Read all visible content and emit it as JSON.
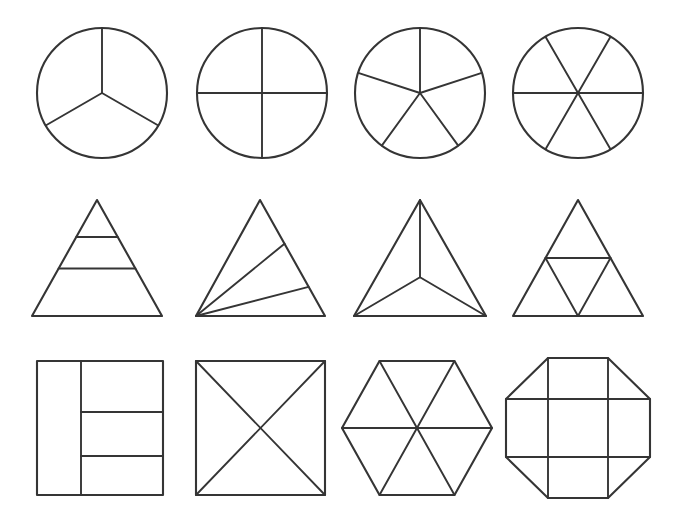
{
  "page": {
    "background_color": "#ffffff",
    "line_color": "#353535",
    "width": 678,
    "height": 519,
    "rows": 3,
    "columns": 4,
    "total_shapes": 12
  },
  "shapes": [
    {
      "id": "circle-thirds",
      "row": 1,
      "column": 1,
      "base_shape": "circle",
      "parts": 3,
      "fraction": "1/3",
      "division": "three radii at 90, 210 and 330 degrees",
      "equal_parts": true,
      "center": {
        "x": 102,
        "y": 93
      },
      "radius": 65
    },
    {
      "id": "circle-quarters",
      "row": 1,
      "column": 2,
      "base_shape": "circle",
      "parts": 4,
      "fraction": "1/4",
      "division": "vertical and horizontal diameters",
      "equal_parts": true,
      "center": {
        "x": 262,
        "y": 93
      },
      "radius": 65
    },
    {
      "id": "circle-fifths",
      "row": 1,
      "column": 3,
      "base_shape": "circle",
      "parts": 5,
      "fraction": "1/5",
      "division": "five radii at 72 degree spacing starting at 90 degrees",
      "equal_parts": true,
      "center": {
        "x": 420,
        "y": 93
      },
      "radius": 65
    },
    {
      "id": "circle-sixths",
      "row": 1,
      "column": 4,
      "base_shape": "circle",
      "parts": 6,
      "fraction": "1/6",
      "division": "three diameters at 0, 60 and 120 degrees",
      "equal_parts": true,
      "center": {
        "x": 578,
        "y": 93
      },
      "radius": 65
    },
    {
      "id": "triangle-horizontal-bands",
      "row": 2,
      "column": 1,
      "base_shape": "triangle",
      "parts": 3,
      "fraction": "unequal thirds",
      "division": "two horizontal lines parallel to the base",
      "equal_parts": false,
      "apex": {
        "x": 97,
        "y": 200
      },
      "base_left": {
        "x": 32,
        "y": 316
      },
      "base_right": {
        "x": 162,
        "y": 316
      }
    },
    {
      "id": "triangle-oblique-bands",
      "row": 2,
      "column": 2,
      "base_shape": "triangle",
      "parts": 3,
      "fraction": "unequal thirds",
      "division": "two slanted lines from the bottom-left vertex to the right side",
      "equal_parts": false,
      "apex": {
        "x": 260,
        "y": 200
      },
      "base_left": {
        "x": 196,
        "y": 316
      },
      "base_right": {
        "x": 325,
        "y": 316
      }
    },
    {
      "id": "triangle-centroid-thirds",
      "row": 2,
      "column": 3,
      "base_shape": "triangle",
      "parts": 3,
      "fraction": "1/3",
      "division": "center point joined to all three vertices",
      "equal_parts": true,
      "apex": {
        "x": 420,
        "y": 200
      },
      "base_left": {
        "x": 354,
        "y": 316
      },
      "base_right": {
        "x": 486,
        "y": 316
      }
    },
    {
      "id": "triangle-medial-quarters",
      "row": 2,
      "column": 4,
      "base_shape": "triangle",
      "parts": 4,
      "fraction": "1/4",
      "division": "midpoint (medial) triangle creating four congruent triangles",
      "equal_parts": true,
      "apex": {
        "x": 578,
        "y": 200
      },
      "base_left": {
        "x": 513,
        "y": 316
      },
      "base_right": {
        "x": 643,
        "y": 316
      }
    },
    {
      "id": "square-column-and-bands",
      "row": 3,
      "column": 1,
      "base_shape": "square",
      "parts": 4,
      "fraction": "unequal quarters",
      "division": "one vertical line at one third, right part split into three horizontal bands",
      "equal_parts": false,
      "left": 37,
      "top": 361,
      "right": 163,
      "bottom": 495
    },
    {
      "id": "square-diagonals",
      "row": 3,
      "column": 2,
      "base_shape": "square",
      "parts": 4,
      "fraction": "1/4",
      "division": "both diagonals creating four triangles",
      "equal_parts": true,
      "left": 196,
      "top": 361,
      "right": 325,
      "bottom": 495
    },
    {
      "id": "hexagon-sixths",
      "row": 3,
      "column": 3,
      "base_shape": "hexagon",
      "parts": 6,
      "fraction": "1/6",
      "division": "three long diagonals through the center",
      "equal_parts": true,
      "center": {
        "x": 417,
        "y": 428
      },
      "radius_x": 75,
      "radius_y": 67
    },
    {
      "id": "octagon-grid",
      "row": 3,
      "column": 4,
      "base_shape": "octagon",
      "parts": 9,
      "fraction": "unequal parts",
      "division": "two vertical and two horizontal lines forming a three by three grid",
      "equal_parts": false,
      "center": {
        "x": 578,
        "y": 428
      },
      "radius_x": 72,
      "radius_y": 70
    }
  ],
  "labels": {
    "row_1": "circles",
    "row_2": "triangles",
    "row_3": "quadrilaterals and polygons"
  }
}
